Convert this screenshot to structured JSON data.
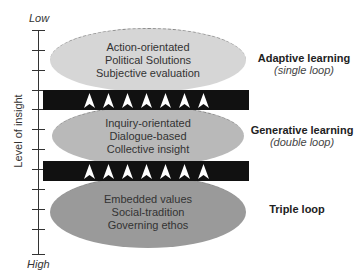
{
  "axis": {
    "top_label": "Low",
    "bottom_label": "High",
    "title": "Level of insight",
    "tick_count": 12
  },
  "layers": [
    {
      "lines": [
        "Action-orientated",
        "Political Solutions",
        "Subjective evaluation"
      ],
      "fill": "#d6d6d6",
      "label_title": "Adaptive learning",
      "label_sub": "(single loop)"
    },
    {
      "lines": [
        "Inquiry-orientated",
        "Dialogue-based",
        "Collective insight"
      ],
      "fill": "#b9b9b9",
      "label_title": "Generative learning",
      "label_sub": "(double loop)"
    },
    {
      "lines": [
        "Embedded values",
        "Social-tradition",
        "Governing ethos"
      ],
      "fill": "#9a9a9a",
      "label_title": "Triple loop",
      "label_sub": ""
    }
  ],
  "bands": [
    {
      "arrow_count": 7,
      "arrow_icon": "arrow-up-icon",
      "color": "#111111"
    },
    {
      "arrow_count": 7,
      "arrow_icon": "arrow-up-icon",
      "color": "#111111"
    }
  ]
}
